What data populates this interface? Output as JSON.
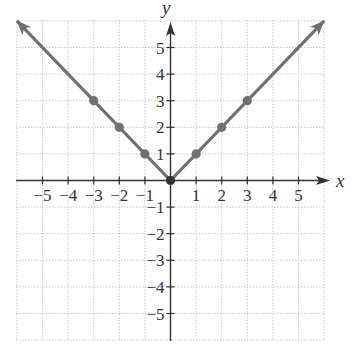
{
  "chart_data": {
    "type": "line",
    "title": "",
    "function": "y = |x|",
    "xlabel": "x",
    "ylabel": "y",
    "xlim": [
      -6,
      6
    ],
    "ylim": [
      -6,
      6
    ],
    "grid": true,
    "grid_style": "dotted",
    "x_ticks": [
      -5,
      -4,
      -3,
      -2,
      -1,
      1,
      2,
      3,
      4,
      5
    ],
    "y_ticks": [
      -5,
      -4,
      -3,
      -2,
      -1,
      1,
      2,
      3,
      4,
      5
    ],
    "x_tick_labels": [
      "−5",
      "−4",
      "−3",
      "−2",
      "−1",
      "1",
      "2",
      "3",
      "4",
      "5"
    ],
    "y_tick_labels": [
      "−5",
      "−4",
      "−3",
      "−2",
      "−1",
      "1",
      "2",
      "3",
      "4",
      "5"
    ],
    "series": [
      {
        "name": "y = |x|",
        "line": {
          "x": [
            -6,
            0,
            6
          ],
          "y": [
            6,
            0,
            6
          ],
          "arrows_at_ends": true
        },
        "points": {
          "x": [
            -3,
            -2,
            -1,
            0,
            1,
            2,
            3
          ],
          "y": [
            3,
            2,
            1,
            0,
            1,
            2,
            3
          ]
        },
        "color": "#707070"
      }
    ],
    "colors": {
      "line": "#707070",
      "axis": "#333333",
      "grid": "#c8c8c8"
    }
  },
  "labels": {
    "x_axis": "x",
    "y_axis": "y"
  }
}
